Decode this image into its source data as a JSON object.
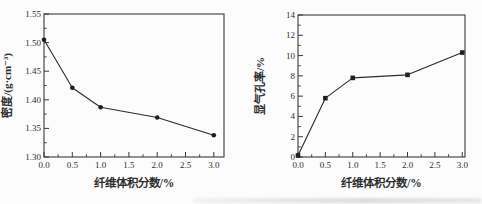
{
  "page": {
    "background": "#fcfcfc",
    "axis_color": "#3a3a3a",
    "text_color": "#2e2e2e"
  },
  "chart_data": [
    {
      "type": "line",
      "name": "density-vs-fiber-fraction",
      "title": "",
      "xlabel": "纤维体积分数/%",
      "ylabel": "密度/(g·cm⁻³)",
      "x": [
        0.0,
        0.5,
        1.0,
        2.0,
        3.0
      ],
      "y": [
        1.505,
        1.421,
        1.387,
        1.369,
        1.338
      ],
      "xlim": [
        0,
        3.18
      ],
      "ylim": [
        1.3,
        1.55
      ],
      "xticks": [
        0,
        0.5,
        1.0,
        1.5,
        2.0,
        2.5,
        3.0
      ],
      "xtick_labels": [
        "0.0",
        "0.5",
        "1.0",
        "1.5",
        "2.0",
        "2.5",
        "3.0"
      ],
      "yticks": [
        1.3,
        1.35,
        1.4,
        1.45,
        1.5,
        1.55
      ],
      "ytick_labels": [
        "1.30",
        "1.35",
        "1.40",
        "1.45",
        "1.50",
        "1.55"
      ],
      "x_minor_step": 0.25,
      "y_minor_step": 0.025,
      "marker": "circle",
      "line_color": "#2b2b2b",
      "marker_color": "#1f1f1f",
      "legend": null,
      "grid": false
    },
    {
      "type": "line",
      "name": "porosity-vs-fiber-fraction",
      "title": "",
      "xlabel": "纤维体积分数/%",
      "ylabel": "显气孔率/%",
      "x": [
        0.0,
        0.5,
        1.0,
        2.0,
        3.0
      ],
      "y": [
        0.15,
        5.8,
        7.8,
        8.1,
        10.3
      ],
      "xlim": [
        0,
        3.05
      ],
      "ylim": [
        0,
        14
      ],
      "xticks": [
        0,
        0.5,
        1.0,
        1.5,
        2.0,
        2.5,
        3.0
      ],
      "xtick_labels": [
        "0.0",
        "0.5",
        "1.0",
        "1.5",
        "2.0",
        "2.5",
        "3.0"
      ],
      "yticks": [
        0,
        2,
        4,
        6,
        8,
        10,
        12,
        14
      ],
      "ytick_labels": [
        "0",
        "2",
        "4",
        "6",
        "8",
        "10",
        "12",
        "14"
      ],
      "x_minor_step": 0.25,
      "y_minor_step": 1,
      "marker": "square",
      "line_color": "#2b2b2b",
      "marker_color": "#1f1f1f",
      "legend": null,
      "grid": false
    }
  ]
}
